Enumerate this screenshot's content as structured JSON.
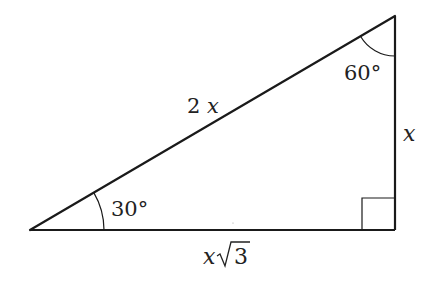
{
  "diagram": {
    "type": "right-triangle-30-60-90",
    "colors": {
      "stroke": "#1a1a1a",
      "background": "#ffffff",
      "text": "#222222"
    },
    "vertices": {
      "bottom_left": {
        "x": 30,
        "y": 230,
        "angle": "30°"
      },
      "top_right": {
        "x": 395,
        "y": 16,
        "angle": "60°"
      },
      "bottom_right": {
        "x": 395,
        "y": 230,
        "angle": "90°"
      }
    },
    "labels": {
      "hypotenuse": "2x",
      "vertical_leg": "x",
      "horizontal_leg_prefix": "x",
      "horizontal_leg_radicand": "3",
      "angle_bottom_left": "30°",
      "angle_top_right": "60°"
    }
  }
}
